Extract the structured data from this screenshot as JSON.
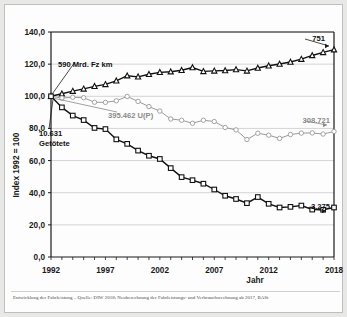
{
  "figure": {
    "caption": "Entwicklung der Fahrleistung – Quelle: DIW 2018; Neuberechnung der Fahrleistungs- und Verbrauchsrechnung ab 2017, BASt",
    "background": "#fdfdfd",
    "frame_color": "#bfbfbf"
  },
  "chart_data": {
    "type": "line",
    "title": "",
    "xlabel": "Jahr",
    "ylabel": "Index 1992 = 100",
    "xlim": [
      1992,
      2018
    ],
    "ylim": [
      0,
      140
    ],
    "yticks": [
      "0,0",
      "20,0",
      "40,0",
      "60,0",
      "80,0",
      "100,0",
      "120,0",
      "140,0"
    ],
    "ytick_values": [
      0,
      20,
      40,
      60,
      80,
      100,
      120,
      140
    ],
    "xticks": [
      "1992",
      "1997",
      "2002",
      "2007",
      "2012",
      "2018"
    ],
    "xtick_values": [
      1992,
      1997,
      2002,
      2007,
      2012,
      2018
    ],
    "grid": "horizontal",
    "legend": "none",
    "x": [
      1992,
      1993,
      1994,
      1995,
      1996,
      1997,
      1998,
      1999,
      2000,
      2001,
      2002,
      2003,
      2004,
      2005,
      2006,
      2007,
      2008,
      2009,
      2010,
      2011,
      2012,
      2013,
      2014,
      2015,
      2016,
      2017,
      2018
    ],
    "series": [
      {
        "name": "Fahrleistung",
        "unit": "Mrd. Fz km",
        "color": "#111111",
        "marker": "triangle",
        "start_annotation": "590 Mrd. Fz km",
        "end_annotation": "751",
        "values": [
          100.0,
          101.6,
          103.2,
          104.6,
          106.2,
          107.4,
          109.6,
          112.8,
          112.1,
          113.7,
          114.9,
          115.3,
          116.2,
          117.9,
          115.5,
          115.8,
          116.0,
          116.6,
          115.8,
          117.6,
          119.0,
          120.1,
          121.3,
          123.1,
          125.4,
          127.3,
          129.0
        ]
      },
      {
        "name": "Unfaelle mit Personenschaden",
        "unit": "U(P)",
        "color": "#9a9a9a",
        "marker": "circle",
        "start_annotation": "395.462 U(P)",
        "end_annotation": "308.721",
        "values": [
          100.0,
          98.9,
          99.4,
          99.1,
          96.3,
          96.2,
          97.2,
          99.9,
          96.8,
          93.6,
          90.8,
          85.9,
          85.1,
          83.2,
          85.1,
          84.3,
          80.6,
          79.1,
          73.1,
          77.0,
          75.8,
          73.8,
          76.2,
          77.1,
          77.2,
          76.5,
          78.1
        ]
      },
      {
        "name": "Getoetete",
        "unit": "Getötete",
        "color": "#111111",
        "marker": "square",
        "start_annotation": "10.631 Getötete",
        "end_annotation": "3.275",
        "values": [
          100.0,
          93.1,
          88.0,
          85.2,
          80.3,
          79.6,
          73.2,
          70.4,
          66.2,
          63.0,
          61.0,
          55.3,
          49.7,
          47.8,
          45.6,
          42.0,
          38.1,
          36.1,
          33.5,
          37.3,
          33.1,
          30.8,
          31.2,
          32.0,
          29.5,
          29.4,
          30.8
        ]
      }
    ],
    "annotations": [
      {
        "id": "fahrleistung-start",
        "text": "590 Mrd. Fz km"
      },
      {
        "id": "unfaelle-start",
        "text": "395.462  U(P)"
      },
      {
        "id": "getoetete-start-1",
        "text": "10.631"
      },
      {
        "id": "getoetete-start-2",
        "text": "Getötete"
      },
      {
        "id": "fahrleistung-end",
        "text": "751"
      },
      {
        "id": "unfaelle-end",
        "text": "308.721"
      },
      {
        "id": "getoetete-end",
        "text": "3.275"
      }
    ]
  }
}
